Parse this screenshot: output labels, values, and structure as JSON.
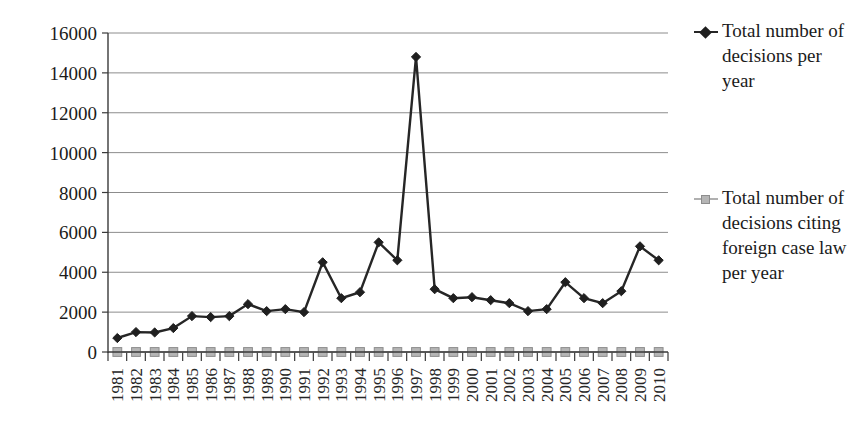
{
  "chart_data": {
    "type": "line",
    "title": "",
    "subtitle": "",
    "xlabel": "",
    "ylabel": "",
    "ylim": [
      0,
      16000
    ],
    "ytick_step": 2000,
    "grid": true,
    "legend_position": "right",
    "categories": [
      "1981",
      "1982",
      "1983",
      "1984",
      "1985",
      "1986",
      "1987",
      "1988",
      "1989",
      "1990",
      "1991",
      "1992",
      "1993",
      "1994",
      "1995",
      "1996",
      "1997",
      "1998",
      "1999",
      "2000",
      "2001",
      "2002",
      "2003",
      "2004",
      "2005",
      "2006",
      "2007",
      "2008",
      "2009",
      "2010"
    ],
    "ytick_labels": [
      "0",
      "2000",
      "4000",
      "6000",
      "8000",
      "10000",
      "12000",
      "14000",
      "16000"
    ],
    "ytick_values": [
      0,
      2000,
      4000,
      6000,
      8000,
      10000,
      12000,
      14000,
      16000
    ],
    "series": [
      {
        "name": "Total number of decisions per year",
        "marker": "diamond",
        "color": "#262626",
        "values": [
          700,
          1000,
          980,
          1200,
          1800,
          1750,
          1800,
          2400,
          2050,
          2150,
          2000,
          4500,
          2700,
          3000,
          5500,
          4600,
          14800,
          3150,
          2700,
          2750,
          2600,
          2450,
          2050,
          2150,
          3500,
          2700,
          2450,
          3050,
          5300,
          4600
        ]
      },
      {
        "name": "Total number of decisions citing foreign case law per year",
        "marker": "square",
        "color": "#b5b5b5",
        "values": [
          0,
          0,
          0,
          0,
          0,
          0,
          0,
          0,
          0,
          0,
          0,
          0,
          0,
          0,
          0,
          0,
          0,
          0,
          0,
          0,
          0,
          0,
          0,
          0,
          0,
          0,
          0,
          0,
          0,
          0
        ]
      }
    ]
  },
  "legend": {
    "entries": [
      {
        "label": "Total number of decisions per year",
        "marker": "diamond-marker",
        "color": "#262626"
      },
      {
        "label": "Total number of decisions citing foreign case law per year",
        "marker": "square-marker",
        "color": "#b5b5b5"
      }
    ]
  }
}
